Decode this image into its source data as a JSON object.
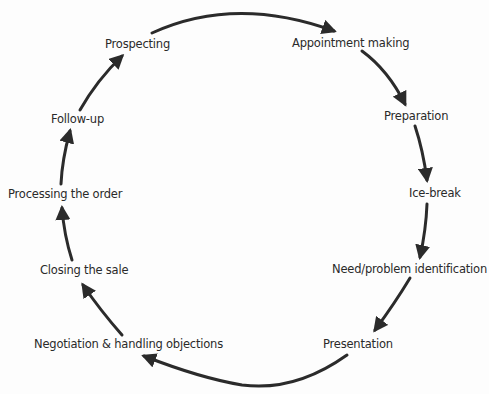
{
  "diagram": {
    "direction": "clockwise",
    "stages": [
      {
        "id": "prospecting",
        "label": "Prospecting"
      },
      {
        "id": "appointment",
        "label": "Appointment making"
      },
      {
        "id": "preparation",
        "label": "Preparation"
      },
      {
        "id": "icebreak",
        "label": "Ice-break"
      },
      {
        "id": "need",
        "label": "Need/problem identification"
      },
      {
        "id": "presentation",
        "label": "Presentation"
      },
      {
        "id": "negotiation",
        "label": "Negotiation & handling objections"
      },
      {
        "id": "closing",
        "label": "Closing the sale"
      },
      {
        "id": "processing",
        "label": "Processing the order"
      },
      {
        "id": "followup",
        "label": "Follow-up"
      }
    ],
    "edges": [
      {
        "from": "prospecting",
        "to": "appointment"
      },
      {
        "from": "appointment",
        "to": "preparation"
      },
      {
        "from": "preparation",
        "to": "icebreak"
      },
      {
        "from": "icebreak",
        "to": "need"
      },
      {
        "from": "need",
        "to": "presentation"
      },
      {
        "from": "presentation",
        "to": "negotiation"
      },
      {
        "from": "negotiation",
        "to": "closing"
      },
      {
        "from": "closing",
        "to": "processing"
      },
      {
        "from": "processing",
        "to": "followup"
      },
      {
        "from": "followup",
        "to": "prospecting"
      }
    ],
    "arrow_color": "#2b2b2b",
    "text_color": "#2a2a2a"
  }
}
